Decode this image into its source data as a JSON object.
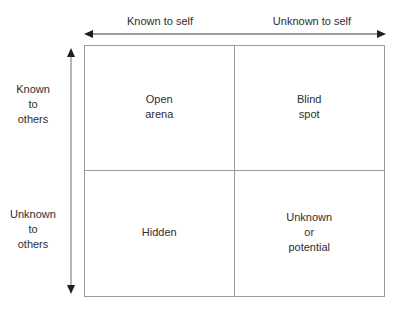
{
  "diagram": {
    "line_color": "#9a9a9a",
    "text_color": "#2e2e2e",
    "background_color": "#ffffff",
    "horizontal_axis": {
      "arrow_type": "double-headed",
      "labels": [
        {
          "text": "Known to self"
        },
        {
          "text": "Unknown to self"
        }
      ]
    },
    "vertical_axis": {
      "arrow_type": "double-headed",
      "labels": [
        {
          "lines": [
            "Known",
            "to",
            "others"
          ]
        },
        {
          "lines": [
            "Unknown",
            "to",
            "others"
          ]
        }
      ]
    },
    "quadrants": [
      {
        "position": "top-left",
        "lines": [
          "Open",
          "arena"
        ]
      },
      {
        "position": "top-right",
        "lines": [
          "Blind",
          "spot"
        ]
      },
      {
        "position": "bottom-left",
        "lines": [
          "Hidden"
        ]
      },
      {
        "position": "bottom-right",
        "lines": [
          "Unknown",
          "or",
          "potential"
        ]
      }
    ]
  }
}
